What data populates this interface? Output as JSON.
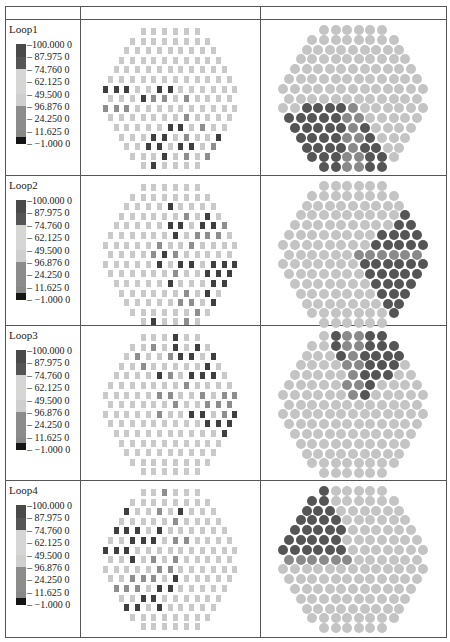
{
  "table": {
    "header": [
      "",
      "",
      ""
    ],
    "rows": [
      {
        "label": "Loop1",
        "row_height": 156
      },
      {
        "label": "Loop2",
        "row_height": 150
      },
      {
        "label": "Loop3",
        "row_height": 155
      },
      {
        "label": "Loop4",
        "row_height": 157
      }
    ]
  },
  "legend": {
    "ticks": [
      "100.000 0",
      "87.975 0",
      "74.760 0",
      "62.125 0",
      "49.500 0",
      "96.876 0",
      "24.250 0",
      "11.625 0",
      "−1.000 0"
    ],
    "bands": [
      {
        "color": "#4a4a4a",
        "height": 13
      },
      {
        "color": "#555555",
        "height": 12
      },
      {
        "color": "#d6d6d6",
        "height": 25
      },
      {
        "color": "#cfcfcf",
        "height": 12
      },
      {
        "color": "#8c8c8c",
        "height": 25
      },
      {
        "color": "#888888",
        "height": 6
      },
      {
        "color": "#151515",
        "height": 7
      }
    ]
  },
  "colors": {
    "light": "#c9c9c9",
    "mid": "#8e8e8e",
    "dark": "#3f3f3f",
    "black": "#1a1a1a",
    "circle_light": "#c4c4c4",
    "circle_dark": "#555555",
    "border": "#555555"
  },
  "chart_data": {
    "type": "heatmap",
    "title": "",
    "legend_ticks": [
      100.0,
      87.975,
      74.76,
      62.125,
      49.5,
      96.876,
      24.25,
      11.625,
      -1.0
    ],
    "row_counts": [
      6,
      8,
      9,
      10,
      11,
      12,
      13,
      12,
      13,
      12,
      11,
      10,
      9,
      8,
      6
    ],
    "loops": [
      {
        "name": "Loop1",
        "squares_dark": [
          [
            6,
            0
          ],
          [
            6,
            1
          ],
          [
            6,
            2
          ],
          [
            6,
            5
          ],
          [
            6,
            6
          ],
          [
            7,
            3
          ],
          [
            10,
            5
          ],
          [
            10,
            6
          ],
          [
            11,
            3
          ],
          [
            11,
            4
          ],
          [
            11,
            9
          ],
          [
            12,
            2
          ],
          [
            12,
            3
          ],
          [
            12,
            5
          ],
          [
            12,
            6
          ],
          [
            12,
            11
          ],
          [
            13,
            3
          ],
          [
            14,
            1
          ]
        ],
        "squares_mid": [
          [
            7,
            4
          ],
          [
            7,
            5
          ],
          [
            7,
            7
          ],
          [
            8,
            0
          ],
          [
            8,
            1
          ],
          [
            8,
            2
          ],
          [
            9,
            7
          ],
          [
            10,
            8
          ],
          [
            11,
            6
          ],
          [
            12,
            8
          ],
          [
            12,
            10
          ],
          [
            13,
            5
          ],
          [
            13,
            7
          ]
        ],
        "circles_dark_region": "lower-left third"
      },
      {
        "name": "Loop2",
        "squares_dark": [
          [
            2,
            4
          ],
          [
            2,
            9
          ],
          [
            3,
            8
          ],
          [
            4,
            5
          ],
          [
            4,
            6
          ],
          [
            4,
            8
          ],
          [
            4,
            9
          ],
          [
            5,
            6
          ],
          [
            7,
            5
          ],
          [
            8,
            5
          ],
          [
            8,
            7
          ],
          [
            8,
            8
          ],
          [
            8,
            10
          ],
          [
            8,
            11
          ],
          [
            8,
            12
          ],
          [
            9,
            9
          ],
          [
            9,
            10
          ],
          [
            9,
            11
          ],
          [
            10,
            5
          ],
          [
            10,
            9
          ],
          [
            10,
            10
          ],
          [
            10,
            11
          ],
          [
            11,
            8
          ],
          [
            12,
            8
          ],
          [
            12,
            9
          ],
          [
            14,
            1
          ]
        ],
        "squares_mid": [
          [
            3,
            6
          ],
          [
            4,
            10
          ],
          [
            4,
            11
          ],
          [
            5,
            8
          ],
          [
            5,
            9
          ],
          [
            5,
            10
          ],
          [
            6,
            5
          ],
          [
            6,
            8
          ],
          [
            7,
            4
          ],
          [
            7,
            6
          ],
          [
            9,
            6
          ],
          [
            11,
            6
          ],
          [
            12,
            5
          ],
          [
            12,
            6
          ],
          [
            13,
            6
          ],
          [
            14,
            4
          ]
        ],
        "circles_dark_region": "right third"
      },
      {
        "name": "Loop3",
        "squares_dark": [
          [
            0,
            3
          ],
          [
            1,
            4
          ],
          [
            1,
            6
          ],
          [
            2,
            5
          ],
          [
            2,
            6
          ],
          [
            2,
            8
          ],
          [
            2,
            9
          ],
          [
            3,
            8
          ],
          [
            4,
            4
          ],
          [
            4,
            7
          ],
          [
            4,
            8
          ],
          [
            4,
            9
          ],
          [
            8,
            8
          ],
          [
            8,
            9
          ],
          [
            8,
            12
          ],
          [
            9,
            9
          ],
          [
            9,
            10
          ],
          [
            9,
            11
          ],
          [
            10,
            10
          ],
          [
            10,
            11
          ]
        ],
        "squares_mid": [
          [
            1,
            2
          ],
          [
            2,
            1
          ],
          [
            2,
            4
          ],
          [
            3,
            2
          ],
          [
            4,
            5
          ],
          [
            5,
            7
          ],
          [
            6,
            5
          ],
          [
            6,
            6
          ],
          [
            6,
            9
          ],
          [
            6,
            11
          ],
          [
            6,
            12
          ],
          [
            7,
            6
          ],
          [
            7,
            9
          ],
          [
            7,
            10
          ],
          [
            7,
            11
          ],
          [
            8,
            5
          ],
          [
            8,
            11
          ],
          [
            8,
            12
          ]
        ],
        "circles_dark_region": "top-right third"
      },
      {
        "name": "Loop4",
        "squares_dark": [
          [
            2,
            0
          ],
          [
            2,
            5
          ],
          [
            4,
            0
          ],
          [
            4,
            1
          ],
          [
            4,
            2
          ],
          [
            4,
            4
          ],
          [
            5,
            2
          ],
          [
            5,
            3
          ],
          [
            5,
            4
          ],
          [
            6,
            0
          ],
          [
            6,
            1
          ],
          [
            6,
            2
          ],
          [
            7,
            2
          ],
          [
            9,
            6
          ],
          [
            10,
            4
          ],
          [
            10,
            5
          ],
          [
            11,
            2
          ],
          [
            11,
            3
          ],
          [
            12,
            0
          ],
          [
            12,
            1
          ],
          [
            12,
            3
          ]
        ],
        "squares_mid": [
          [
            0,
            2
          ],
          [
            2,
            3
          ],
          [
            3,
            5
          ],
          [
            5,
            6
          ],
          [
            5,
            7
          ],
          [
            7,
            4
          ],
          [
            7,
            6
          ],
          [
            8,
            5
          ],
          [
            8,
            6
          ],
          [
            9,
            2
          ],
          [
            9,
            3
          ],
          [
            9,
            4
          ],
          [
            10,
            0
          ],
          [
            10,
            1
          ],
          [
            10,
            2
          ]
        ],
        "circles_dark_region": "top-left third"
      }
    ]
  }
}
